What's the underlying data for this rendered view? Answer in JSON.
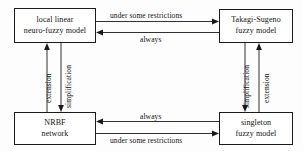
{
  "diagram": {
    "nodes": [
      {
        "id": "local-linear-neuro-fuzzy-model",
        "line1": "local linear",
        "line2": "neuro-fuzzy model"
      },
      {
        "id": "takagi-sugeno-fuzzy-model",
        "line1": "Takagi-Sugeno",
        "line2": "fuzzy model"
      },
      {
        "id": "nrbf-network",
        "line1": "NRBF",
        "line2": "network"
      },
      {
        "id": "singleton-fuzzy-model",
        "line1": "singleton",
        "line2": "fuzzy model"
      }
    ],
    "edges": [
      {
        "id": "top-rightward",
        "label": "under some restrictions",
        "from": "local-linear-neuro-fuzzy-model",
        "to": "takagi-sugeno-fuzzy-model",
        "direction": "right"
      },
      {
        "id": "top-leftward",
        "label": "always",
        "from": "takagi-sugeno-fuzzy-model",
        "to": "local-linear-neuro-fuzzy-model",
        "direction": "left"
      },
      {
        "id": "bottom-leftward",
        "label": "always",
        "from": "singleton-fuzzy-model",
        "to": "nrbf-network",
        "direction": "left"
      },
      {
        "id": "bottom-rightward",
        "label": "under some restrictions",
        "from": "nrbf-network",
        "to": "singleton-fuzzy-model",
        "direction": "right"
      },
      {
        "id": "left-upward",
        "label": "extension",
        "from": "nrbf-network",
        "to": "local-linear-neuro-fuzzy-model",
        "direction": "up"
      },
      {
        "id": "left-downward",
        "label": "simplification",
        "from": "local-linear-neuro-fuzzy-model",
        "to": "nrbf-network",
        "direction": "down"
      },
      {
        "id": "right-downward",
        "label": "simplification",
        "from": "takagi-sugeno-fuzzy-model",
        "to": "singleton-fuzzy-model",
        "direction": "down"
      },
      {
        "id": "right-upward",
        "label": "extension",
        "from": "singleton-fuzzy-model",
        "to": "takagi-sugeno-fuzzy-model",
        "direction": "up"
      }
    ],
    "colors": {
      "line": "#1a1a1a",
      "text": "#111111",
      "box_fill": "#ffffff",
      "background": "#fdfdfd"
    }
  }
}
